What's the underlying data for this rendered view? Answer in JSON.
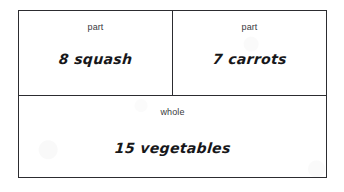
{
  "diagram": {
    "type": "part-part-whole bar model",
    "rows": {
      "top": {
        "parts": [
          {
            "label": "part",
            "value": "8 squash",
            "number": "8",
            "noun": "squash"
          },
          {
            "label": "part",
            "value": "7 carrots",
            "number": "7",
            "noun": "carrots"
          }
        ]
      },
      "bottom": {
        "whole": {
          "label": "whole",
          "value": "15 vegetables",
          "number": "15",
          "noun": "vegetables"
        }
      }
    },
    "colors": {
      "border": "#2c2c30",
      "background": "#ffffff",
      "label_text": "#3a3a3e",
      "handwriting_text": "#17171a"
    }
  }
}
